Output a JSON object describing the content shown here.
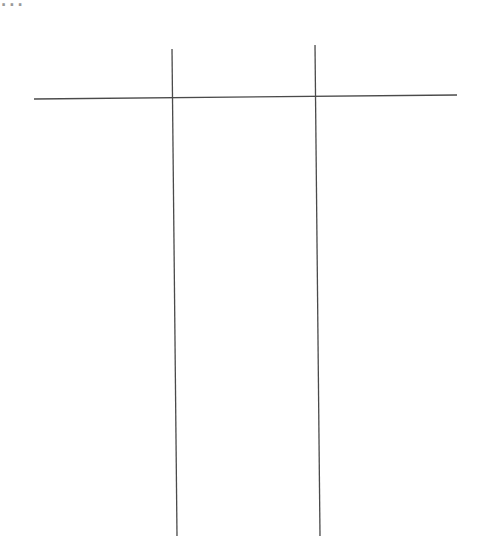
{
  "page": {
    "cropped_heading": "..."
  },
  "lines": {
    "stroke_color": "#4a4a4a",
    "horizontal": {
      "x1": 34,
      "y1": 99,
      "x2": 457,
      "y2": 95
    },
    "vertical_left": {
      "x1": 172,
      "y1": 49,
      "x2": 177,
      "y2": 536
    },
    "vertical_right": {
      "x1": 315,
      "y1": 45,
      "x2": 320,
      "y2": 536
    }
  }
}
